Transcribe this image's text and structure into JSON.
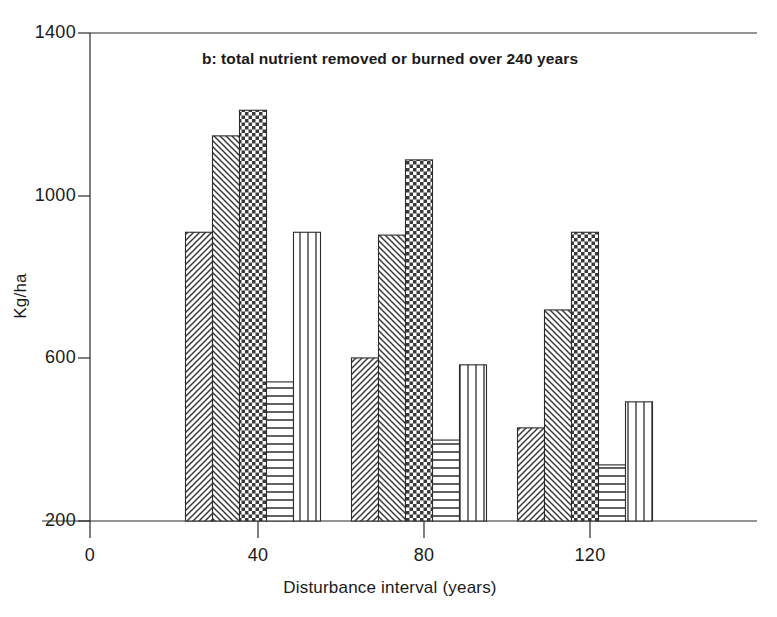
{
  "chart_data": {
    "type": "bar",
    "title": "b: total nutrient removed or burned over 240 years",
    "xlabel": "Disturbance interval (years)",
    "ylabel": "Kg/ha",
    "categories": [
      "40",
      "80",
      "120"
    ],
    "xlim": [
      0,
      140
    ],
    "ylim": [
      200,
      1400
    ],
    "yticks": [
      "200",
      "600",
      "1000",
      "1400"
    ],
    "ytick_values": [
      200,
      600,
      1000,
      1400
    ],
    "xticks": [
      "0",
      "40",
      "80",
      "120"
    ],
    "xtick_values": [
      0,
      40,
      80,
      120
    ],
    "grid": false,
    "legend": "none",
    "series": [
      {
        "name": "series-1",
        "pattern": "diagonal-hatch-forward",
        "values": [
          910,
          601,
          429
        ]
      },
      {
        "name": "series-2",
        "pattern": "diagonal-hatch-backward",
        "values": [
          1147,
          903,
          719
        ]
      },
      {
        "name": "series-3",
        "pattern": "checkerboard",
        "values": [
          1210,
          1088,
          910
        ]
      },
      {
        "name": "series-4",
        "pattern": "horizontal-lines",
        "values": [
          542,
          399,
          338
        ]
      },
      {
        "name": "series-5",
        "pattern": "vertical-lines",
        "values": [
          910,
          584,
          493
        ]
      }
    ]
  },
  "axis": {
    "y_tick_labels": [
      "1400",
      "1000",
      "600",
      "200"
    ],
    "x_tick_labels": [
      "0",
      "40",
      "80",
      "120"
    ]
  },
  "colors": {
    "axis": "#2b2b2b",
    "text": "#1a1a1a",
    "background": "#ffffff",
    "pattern_stroke": "#3a3a3a"
  }
}
